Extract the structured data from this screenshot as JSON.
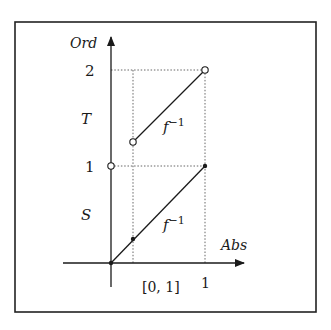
{
  "diagram": {
    "axes": {
      "y_label": "Ord",
      "x_label": "Abs"
    },
    "y_ticks": [
      {
        "label": "2",
        "value": 2
      },
      {
        "label": "1",
        "value": 1
      }
    ],
    "y_region_labels": {
      "upper": "T",
      "lower": "S"
    },
    "x_ticks": [
      {
        "label": "1",
        "value": 1
      }
    ],
    "x_interval_label": "[0, 1]",
    "segments": [
      {
        "name": "upper-segment",
        "label_base": "f",
        "label_sup": "−1",
        "from": {
          "x": 0.1,
          "y": 1.3,
          "endpoint": "open"
        },
        "to": {
          "x": 1,
          "y": 2,
          "endpoint": "open"
        }
      },
      {
        "name": "lower-segment",
        "label_base": "f",
        "label_sup": "−1",
        "from": {
          "x": 0,
          "y": 0,
          "endpoint": "filled"
        },
        "to": {
          "x": 1,
          "y": 1,
          "endpoint": "filled"
        }
      }
    ],
    "points": [
      {
        "name": "open-point-y1-axis",
        "x": 0,
        "y": 1,
        "type": "open"
      },
      {
        "name": "filled-point-lower-mid",
        "x": 0.1,
        "y": 0.1,
        "type": "filled"
      }
    ],
    "colors": {
      "ink": "#1a1a1a",
      "dotted": "#555555",
      "frame": "#222222",
      "background": "#ffffff"
    }
  }
}
